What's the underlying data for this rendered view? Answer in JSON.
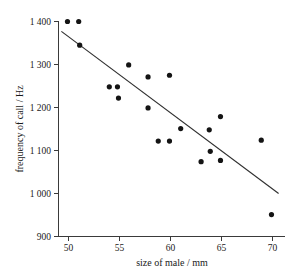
{
  "chart_data": {
    "type": "scatter",
    "title": "",
    "xlabel": "size of male / mm",
    "ylabel": "frequency of call / Hz",
    "xlim": [
      49,
      71
    ],
    "ylim": [
      900,
      1400
    ],
    "xticks": [
      50,
      55,
      60,
      65,
      70
    ],
    "xtick_labels": [
      "50",
      "55",
      "60",
      "65",
      "70"
    ],
    "yticks": [
      900,
      1000,
      1100,
      1200,
      1300,
      1400
    ],
    "ytick_labels": [
      "900",
      "1 000",
      "1 100",
      "1 200",
      "1 300",
      "1 400"
    ],
    "grid": false,
    "legend": false,
    "marker": "filled-circle",
    "marker_color": "#141414",
    "line_color": "#303030",
    "points": [
      {
        "x": 49.9,
        "y": 1400
      },
      {
        "x": 51.0,
        "y": 1400
      },
      {
        "x": 51.1,
        "y": 1345
      },
      {
        "x": 54.0,
        "y": 1248
      },
      {
        "x": 54.8,
        "y": 1248
      },
      {
        "x": 54.9,
        "y": 1222
      },
      {
        "x": 55.9,
        "y": 1299
      },
      {
        "x": 57.8,
        "y": 1271
      },
      {
        "x": 57.8,
        "y": 1199
      },
      {
        "x": 58.8,
        "y": 1122
      },
      {
        "x": 59.9,
        "y": 1275
      },
      {
        "x": 59.9,
        "y": 1122
      },
      {
        "x": 61.0,
        "y": 1151
      },
      {
        "x": 63.0,
        "y": 1074
      },
      {
        "x": 63.8,
        "y": 1148
      },
      {
        "x": 63.9,
        "y": 1098
      },
      {
        "x": 64.9,
        "y": 1179
      },
      {
        "x": 64.9,
        "y": 1077
      },
      {
        "x": 68.9,
        "y": 1124
      },
      {
        "x": 69.9,
        "y": 951
      }
    ],
    "trend_line": {
      "type": "linear-fit",
      "x_start": 49.3,
      "y_start": 1377,
      "x_end": 70.6,
      "y_end": 1000
    }
  }
}
